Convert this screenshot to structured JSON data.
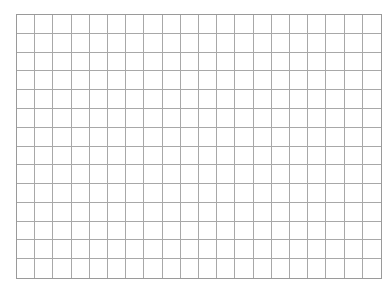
{
  "grid": {
    "columns": 20,
    "rows": 14,
    "line_color": "#a8a8a8",
    "background": "#ffffff"
  }
}
